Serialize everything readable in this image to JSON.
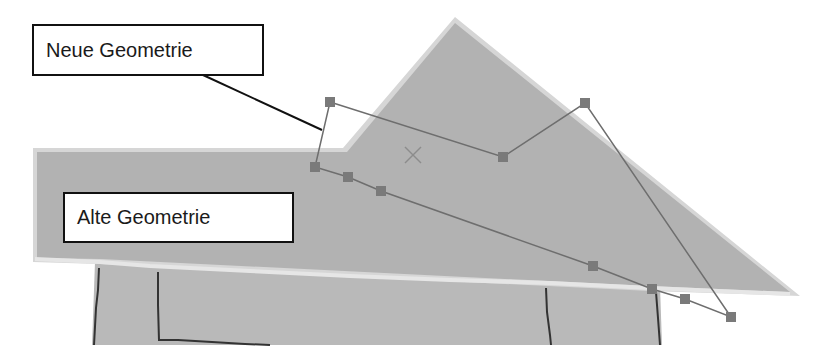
{
  "labels": {
    "new_geometry": "Neue Geometrie",
    "old_geometry": "Alte Geometrie"
  },
  "colors": {
    "background": "#ffffff",
    "old_polygon_fill": "#b4b4b4",
    "old_polygon_edge": "#d8d8d8",
    "building_fill": "#b9b9b9",
    "building_lines": "#333333",
    "new_geometry_line": "#6e6e6e",
    "vertex_fill": "#7a7a7a",
    "leader_line": "#111111",
    "center_marker": "#8c8c8c"
  },
  "new_geometry": {
    "vertices": [
      [
        330,
        102
      ],
      [
        503,
        157
      ],
      [
        585,
        103
      ],
      [
        731,
        317
      ],
      [
        685,
        299
      ],
      [
        652,
        289
      ],
      [
        593,
        266
      ],
      [
        381,
        191
      ],
      [
        348,
        177
      ],
      [
        315,
        167
      ]
    ]
  },
  "center_marker": [
    413,
    155
  ]
}
